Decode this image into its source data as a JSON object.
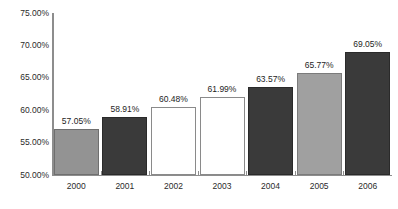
{
  "chart_data": {
    "type": "bar",
    "title": "",
    "subtitle": "",
    "xlabel": "",
    "ylabel": "",
    "ylim": [
      50.0,
      75.0
    ],
    "grid": false,
    "legend": "none",
    "y_tick_labels": [
      "75.00%",
      "70.00%",
      "65.00%",
      "60.00%",
      "55.00%",
      "50.00%"
    ],
    "y_tick_values": [
      75.0,
      70.0,
      65.0,
      60.0,
      55.0,
      50.0
    ],
    "categories": [
      "2000",
      "2001",
      "2002",
      "2003",
      "2004",
      "2005",
      "2006"
    ],
    "values": [
      57.05,
      58.91,
      60.48,
      61.99,
      63.57,
      65.77,
      69.05
    ],
    "data_labels": [
      "57.05%",
      "58.91%",
      "60.48%",
      "61.99%",
      "63.57%",
      "65.77%",
      "69.05%"
    ],
    "bar_colors": [
      "#939393",
      "#3a3a3a",
      "#ffffff",
      "#ffffff",
      "#3a3a3a",
      "#a0a0a0",
      "#3a3a3a"
    ],
    "bar_styles": [
      "gray-medium",
      "dark",
      "white",
      "white",
      "dark",
      "gray-light",
      "dark"
    ],
    "axis_color": "#8d8d8d",
    "background_color": "#ffffff",
    "text_color": "#1d1d1d"
  }
}
